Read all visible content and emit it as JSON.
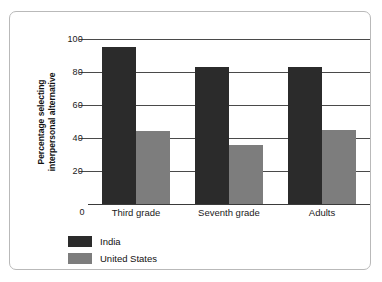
{
  "chart_data": {
    "type": "bar",
    "title": "",
    "subtitle": "",
    "xlabel": "",
    "ylabel": "Percentage selecting interpersonal alternative",
    "ylabel_line1": "Percentage selecting",
    "ylabel_line2": "interpersonal alternative",
    "categories": [
      "Third grade",
      "Seventh grade",
      "Adults"
    ],
    "series": [
      {
        "name": "India",
        "color": "#2b2b2b",
        "values": [
          95,
          83,
          83
        ]
      },
      {
        "name": "United States",
        "color": "#7d7d7d",
        "values": [
          44,
          36,
          45
        ]
      }
    ],
    "ylim": [
      0,
      100
    ],
    "yticks": [
      0,
      20,
      40,
      60,
      80,
      100
    ],
    "ytick_labels": [
      "0",
      "20",
      "40",
      "60",
      "80",
      "100"
    ],
    "grid": true,
    "grid_axis": "y",
    "legend_position": "bottom-left",
    "legend_entries": [
      "India",
      "United States"
    ]
  },
  "frame": {
    "border_color": "#b9b9b9",
    "background": "#ffffff"
  }
}
